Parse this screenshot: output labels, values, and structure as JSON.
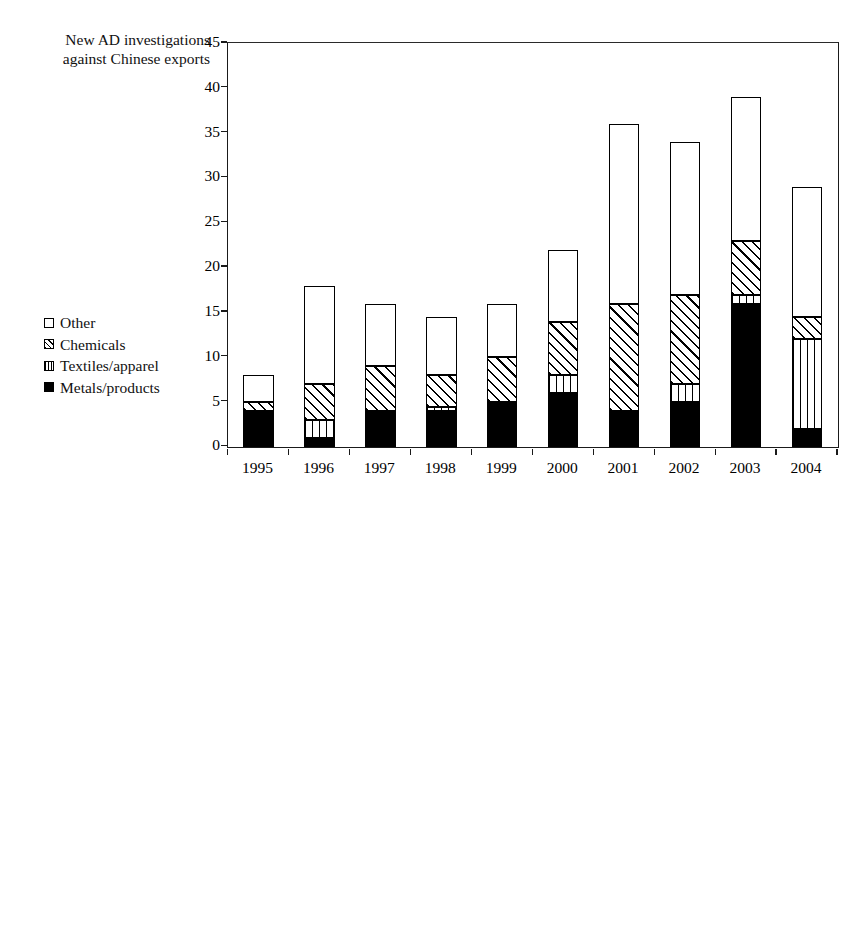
{
  "top": {
    "axis_title": "New AD investigations\nagainst Chinese exports",
    "y_ticks": [
      "0",
      "5",
      "10",
      "15",
      "20",
      "25",
      "30",
      "35",
      "40",
      "45"
    ],
    "x_ticks": [
      "1995",
      "1996",
      "1997",
      "1998",
      "1999",
      "2000",
      "2001",
      "2002",
      "2003",
      "2004"
    ],
    "legend": [
      {
        "key": "other",
        "label": "Other"
      },
      {
        "key": "chemicals",
        "label": "Chemicals"
      },
      {
        "key": "textiles",
        "label": "Textiles/apparel"
      },
      {
        "key": "metals",
        "label": "Metals/products"
      }
    ]
  },
  "bottom": {
    "axis_title": "China's exports,\n$U.S. billions",
    "y_ticks": [
      "0",
      "5",
      "10",
      "15",
      "20",
      "25"
    ],
    "x_ticks": [
      "1995",
      "1996",
      "1997",
      "1998",
      "1999",
      "2000",
      "2001",
      "2002",
      "2003",
      "2004"
    ],
    "legend": [
      {
        "key": "other",
        "label": "Other"
      },
      {
        "key": "chemicals",
        "label": "Chemicals"
      },
      {
        "key": "textiles",
        "label": "Textiles/apparel"
      },
      {
        "key": "metals",
        "label": "Metals/products"
      }
    ]
  },
  "chart_data": [
    {
      "type": "bar",
      "stacked": true,
      "title": "New AD investigations against Chinese exports",
      "xlabel": "",
      "ylabel": "New AD investigations against Chinese exports",
      "ylim": [
        0,
        45
      ],
      "ytick_step": 5,
      "grid": false,
      "legend_position": "left-inside",
      "categories": [
        "1995",
        "1996",
        "1997",
        "1998",
        "1999",
        "2000",
        "2001",
        "2002",
        "2003",
        "2004"
      ],
      "series": [
        {
          "name": "Metals/products",
          "pattern": "solid-black",
          "values": [
            4,
            1,
            4,
            4,
            5,
            6,
            4,
            5,
            16,
            2
          ]
        },
        {
          "name": "Textiles/apparel",
          "pattern": "dotted",
          "values": [
            0,
            2,
            0,
            0.5,
            0,
            2,
            0,
            2,
            1,
            10
          ]
        },
        {
          "name": "Chemicals",
          "pattern": "diagonal-hatch",
          "values": [
            1,
            4,
            5,
            3.5,
            5,
            6,
            12,
            10,
            6,
            2.5
          ]
        },
        {
          "name": "Other",
          "pattern": "white",
          "values": [
            3,
            11,
            7,
            6.5,
            6,
            8,
            20,
            17,
            16,
            14.5
          ]
        }
      ],
      "totals": [
        8,
        18,
        16,
        14,
        16,
        22,
        36,
        34,
        39,
        29
      ]
    },
    {
      "type": "area",
      "stacked": true,
      "title": "China's exports, $U.S. billions",
      "xlabel": "",
      "ylabel": "China's exports, $U.S. billions",
      "ylim": [
        0,
        25
      ],
      "ytick_step": 5,
      "grid": false,
      "legend_position": "left-inside",
      "x": [
        "1995",
        "1996",
        "1997",
        "1998",
        "1999",
        "2000",
        "2001",
        "2002",
        "2003",
        "2004"
      ],
      "series": [
        {
          "name": "Metals/products",
          "pattern": "solid-black",
          "values": [
            0.15,
            0.18,
            0.2,
            0.22,
            0.25,
            0.3,
            0.35,
            0.45,
            0.8,
            1.6
          ]
        },
        {
          "name": "Textiles/apparel",
          "pattern": "dotted",
          "values": [
            0.75,
            0.8,
            0.9,
            0.95,
            1.0,
            1.15,
            1.35,
            1.75,
            2.6,
            3.9
          ]
        },
        {
          "name": "Chemicals",
          "pattern": "diagonal-hatch",
          "values": [
            0.5,
            0.55,
            0.6,
            0.65,
            0.7,
            0.85,
            1.0,
            1.3,
            1.7,
            2.1
          ]
        },
        {
          "name": "Other",
          "pattern": "white",
          "values": [
            2.0,
            2.2,
            3.2,
            3.4,
            3.2,
            4.7,
            4.6,
            6.1,
            8.3,
            13.6
          ]
        }
      ],
      "totals": [
        3.4,
        3.7,
        4.9,
        5.2,
        5.15,
        7.0,
        7.3,
        9.6,
        13.4,
        21.2
      ]
    }
  ]
}
